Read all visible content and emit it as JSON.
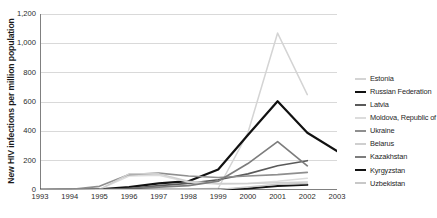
{
  "chart_data": {
    "type": "line",
    "title": "",
    "xlabel": "",
    "ylabel": "New HIV infections per million population",
    "x": [
      1993,
      1994,
      1995,
      1996,
      1997,
      1998,
      1999,
      2000,
      2001,
      2002,
      2003
    ],
    "xlim": [
      1993,
      2003
    ],
    "ylim": [
      0,
      1200
    ],
    "yticks": [
      0,
      200,
      400,
      600,
      800,
      1000,
      1200
    ],
    "ytick_labels": [
      "0",
      "200",
      "400",
      "600",
      "800",
      "1,000",
      "1,200"
    ],
    "xtick_labels": [
      "1993",
      "1994",
      "1995",
      "1996",
      "1997",
      "1998",
      "1999",
      "2000",
      "2001",
      "2002",
      "2003"
    ],
    "grid": "horizontal",
    "legend_position": "right",
    "series": [
      {
        "name": "Estonia",
        "color": "#d4d4d4",
        "width": 1.5,
        "values": [
          1,
          1,
          2,
          3,
          4,
          5,
          12,
          390,
          1070,
          650,
          null
        ]
      },
      {
        "name": "Russian Federation",
        "color": "#111111",
        "width": 2.2,
        "values": [
          1,
          2,
          4,
          20,
          45,
          60,
          140,
          375,
          605,
          390,
          265
        ]
      },
      {
        "name": "Latvia",
        "color": "#5a5a5a",
        "width": 1.6,
        "values": [
          3,
          4,
          6,
          10,
          30,
          45,
          70,
          110,
          165,
          200,
          null
        ]
      },
      {
        "name": "Moldova, Republic of",
        "color": "#dcdcdc",
        "width": 1.5,
        "values": [
          2,
          3,
          5,
          95,
          100,
          55,
          40,
          45,
          60,
          80,
          null
        ]
      },
      {
        "name": "Ukraine",
        "color": "#8f8f8f",
        "width": 1.6,
        "values": [
          2,
          3,
          25,
          105,
          115,
          95,
          85,
          95,
          105,
          120,
          null
        ]
      },
      {
        "name": "Belarus",
        "color": "#cfcfcf",
        "width": 1.5,
        "values": [
          1,
          2,
          3,
          110,
          110,
          60,
          45,
          45,
          50,
          55,
          null
        ]
      },
      {
        "name": "Kazakhstan",
        "color": "#7d7d7d",
        "width": 1.7,
        "values": [
          1,
          1,
          2,
          10,
          20,
          30,
          60,
          180,
          330,
          165,
          null
        ]
      },
      {
        "name": "Kyrgyzstan",
        "color": "#141414",
        "width": 2.0,
        "values": [
          0,
          0,
          1,
          1,
          2,
          2,
          3,
          10,
          28,
          35,
          null
        ]
      },
      {
        "name": "Uzbekistan",
        "color": "#c8c8c8",
        "width": 1.5,
        "values": [
          0,
          0,
          1,
          1,
          1,
          2,
          4,
          20,
          40,
          45,
          null
        ]
      }
    ]
  },
  "axes": {
    "y_title": "New HIV infections per million population"
  },
  "legend": {
    "items": [
      {
        "label": "Estonia"
      },
      {
        "label": "Russian Federation"
      },
      {
        "label": "Latvia"
      },
      {
        "label": "Moldova, Republic of"
      },
      {
        "label": "Ukraine"
      },
      {
        "label": "Belarus"
      },
      {
        "label": "Kazakhstan"
      },
      {
        "label": "Kyrgyzstan"
      },
      {
        "label": "Uzbekistan"
      }
    ]
  },
  "style": {
    "background": "#ffffff",
    "gridline_color": "#d9d9d9",
    "axis_color": "#808080",
    "text_color": "#2b2b2b"
  }
}
